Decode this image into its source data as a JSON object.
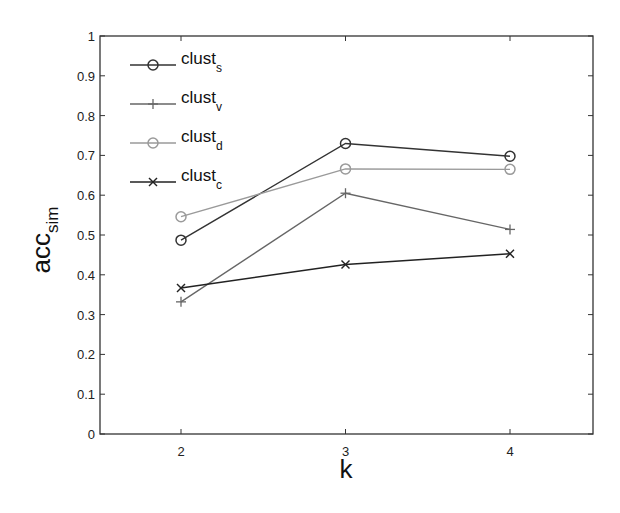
{
  "chart_data": {
    "type": "line",
    "title": "",
    "xlabel": "k",
    "ylabel": "acc",
    "ylabel_sub": "sim",
    "x": [
      2,
      3,
      4
    ],
    "xlim": [
      1.5,
      4.5
    ],
    "ylim": [
      0,
      1
    ],
    "xticks": [
      "2",
      "3",
      "4"
    ],
    "yticks": [
      "0",
      "0.1",
      "0.2",
      "0.3",
      "0.4",
      "0.5",
      "0.6",
      "0.7",
      "0.8",
      "0.9",
      "1"
    ],
    "grid": false,
    "legend_position": "top-left",
    "series": [
      {
        "name": "clust",
        "sub": "s",
        "marker": "circle",
        "color": "#333333",
        "values": [
          0.487,
          0.73,
          0.698
        ]
      },
      {
        "name": "clust",
        "sub": "v",
        "marker": "plus",
        "color": "#666666",
        "values": [
          0.332,
          0.605,
          0.514
        ]
      },
      {
        "name": "clust",
        "sub": "d",
        "marker": "circle",
        "color": "#9a9a9a",
        "values": [
          0.546,
          0.666,
          0.665
        ]
      },
      {
        "name": "clust",
        "sub": "c",
        "marker": "x",
        "color": "#222222",
        "values": [
          0.367,
          0.426,
          0.453
        ]
      }
    ]
  }
}
